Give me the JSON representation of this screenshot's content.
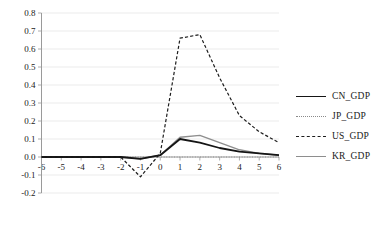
{
  "chart_data": {
    "type": "line",
    "title": "",
    "xlabel": "",
    "ylabel": "",
    "xlim": [
      -6,
      6
    ],
    "ylim": [
      -0.2,
      0.8
    ],
    "grid": true,
    "legend_position": "right",
    "x": [
      -6,
      -5,
      -4,
      -3,
      -2,
      -1,
      0,
      1,
      2,
      3,
      4,
      5,
      6
    ],
    "x_tick_labels": [
      "-6",
      "-5",
      "-4",
      "-3",
      "-2",
      "-1",
      "0",
      "1",
      "2",
      "3",
      "4",
      "5",
      "6"
    ],
    "y_tick_labels": [
      "0.8",
      "0.7",
      "0.6",
      "0.5",
      "0.4",
      "0.3",
      "0.2",
      "0.1",
      "0.0",
      "-0.1",
      "-0.2"
    ],
    "y_ticks": [
      0.8,
      0.7,
      0.6,
      0.5,
      0.4,
      0.3,
      0.2,
      0.1,
      0.0,
      -0.1,
      -0.2
    ],
    "series": [
      {
        "name": "CN_GDP",
        "style": "solid",
        "color": "#151515",
        "values": [
          0.0,
          0.0,
          0.0,
          0.0,
          0.0,
          -0.01,
          0.01,
          0.1,
          0.08,
          0.05,
          0.03,
          0.02,
          0.01
        ]
      },
      {
        "name": "JP_GDP",
        "style": "dotted",
        "color": "#8a8a8a",
        "values": [
          0.0,
          0.0,
          0.0,
          0.0,
          0.0,
          0.0,
          0.0,
          0.0,
          0.0,
          0.0,
          0.0,
          0.0,
          0.0
        ]
      },
      {
        "name": "US_GDP",
        "style": "dashed",
        "color": "#1d1d1d",
        "values": [
          0.0,
          0.0,
          0.0,
          0.0,
          0.0,
          -0.11,
          0.02,
          0.66,
          0.68,
          0.44,
          0.23,
          0.14,
          0.08
        ]
      },
      {
        "name": "KR_GDP",
        "style": "solid",
        "color": "#8e8e8e",
        "values": [
          0.0,
          0.0,
          0.0,
          0.0,
          0.0,
          -0.01,
          0.01,
          0.11,
          0.12,
          0.08,
          0.04,
          0.02,
          0.01
        ]
      }
    ]
  },
  "legend": {
    "items": [
      {
        "label": "CN_GDP"
      },
      {
        "label": "JP_GDP"
      },
      {
        "label": "US_GDP"
      },
      {
        "label": "KR_GDP"
      }
    ]
  }
}
